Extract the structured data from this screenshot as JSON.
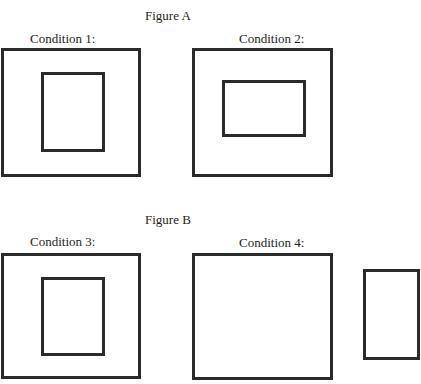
{
  "figure_a": {
    "title": "Figure A",
    "conditions": [
      {
        "label": "Condition 1:",
        "description": "Large square frame enclosing a smaller vertical rectangle (portrait)"
      },
      {
        "label": "Condition 2:",
        "description": "Large square frame enclosing a smaller horizontal rectangle (landscape)"
      }
    ]
  },
  "figure_b": {
    "title": "Figure B",
    "conditions": [
      {
        "label": "Condition 3:",
        "description": "Large square frame enclosing a smaller vertical rectangle"
      },
      {
        "label": "Condition 4:",
        "description": "Empty large frame with a separate vertical rectangle shown outside, to its right"
      }
    ]
  },
  "colors": {
    "stroke": "#2b2b2b",
    "background": "#ffffff",
    "text": "#1e1e1e"
  }
}
